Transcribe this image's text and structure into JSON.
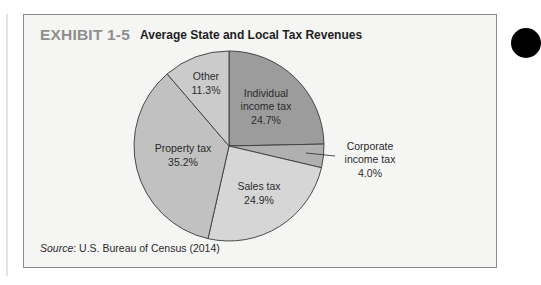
{
  "exhibit": {
    "label": "EXHIBIT 1-5",
    "title": "Average State and Local Tax Revenues",
    "source_prefix": "Source",
    "source_text": ": U.S. Bureau of Census (2014)"
  },
  "chart_data": {
    "type": "pie",
    "title": "Average State and Local Tax Revenues",
    "categories": [
      "Individual income tax",
      "Corporate income tax",
      "Sales tax",
      "Property tax",
      "Other"
    ],
    "values": [
      24.7,
      4.0,
      24.9,
      35.2,
      11.3
    ],
    "unit": "%",
    "start_angle": "12 o'clock",
    "direction": "clockwise",
    "colors": [
      "#9c9c9c",
      "#b0b0b0",
      "#d6d6d6",
      "#c1c1c1",
      "#cbcbcb"
    ],
    "labels": [
      {
        "line1": "Individual",
        "line2": "income tax",
        "line3": "24.7%"
      },
      {
        "line1": "Corporate",
        "line2": "income tax",
        "line3": "4.0%"
      },
      {
        "line1": "Sales tax",
        "line2": "24.9%"
      },
      {
        "line1": "Property tax",
        "line2": "35.2%"
      },
      {
        "line1": "Other",
        "line2": "11.3%"
      }
    ],
    "source": "U.S. Bureau of Census (2014)"
  }
}
